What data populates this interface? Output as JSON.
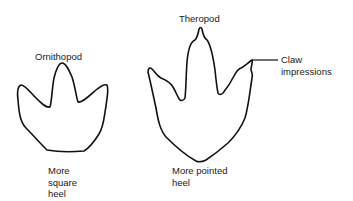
{
  "diagram": {
    "footprints": [
      {
        "name": "Ornithopod",
        "caption": "More\nsquare\nheel"
      },
      {
        "name": "Theropod",
        "caption": "More pointed\nheel"
      }
    ],
    "annotation": {
      "label": "Claw\nimpressions"
    },
    "colors": {
      "stroke": "#111111",
      "background": "#ffffff",
      "text": "#1a1a1a"
    }
  }
}
